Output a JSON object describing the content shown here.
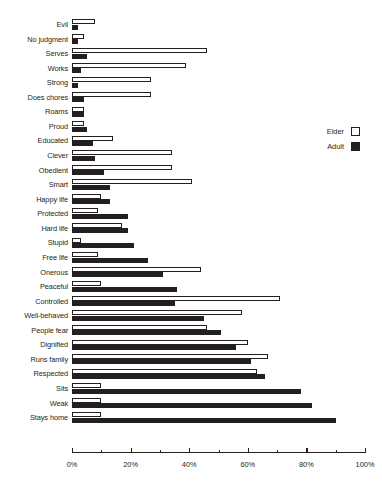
{
  "chart_data": {
    "type": "bar",
    "orientation": "horizontal",
    "title": "",
    "subtitle": "",
    "xlabel": "",
    "ylabel": "",
    "xlim": [
      0,
      100
    ],
    "xunit": "%",
    "grid": false,
    "legend_position": "right",
    "axis": {
      "major_ticks": [
        0,
        20,
        40,
        60,
        80,
        100
      ],
      "major_tick_labels": [
        "0%",
        "20%",
        "40%",
        "60%",
        "80%",
        "100%"
      ],
      "minor_ticks": [
        10,
        30,
        50,
        70,
        90
      ]
    },
    "categories": [
      "Evil",
      "No judgment",
      "Serves",
      "Works",
      "Strong",
      "Does chores",
      "Roams",
      "Proud",
      "Educated",
      "Clever",
      "Obedient",
      "Smart",
      "Happy life",
      "Protected",
      "Hard life",
      "Stupid",
      "Free life",
      "Onerous",
      "Peaceful",
      "Controlled",
      "Well-behaved",
      "People fear",
      "Dignified",
      "Runs family",
      "Respected",
      "Sits",
      "Weak",
      "Stays home"
    ],
    "series": [
      {
        "name": "Elder",
        "color": "#ffffff",
        "edge_color": "#231f20",
        "values": [
          8,
          4,
          46,
          39,
          27,
          27,
          4,
          4,
          14,
          34,
          34,
          41,
          10,
          9,
          17,
          3,
          9,
          44,
          10,
          71,
          58,
          46,
          60,
          67,
          63,
          10,
          10,
          10
        ]
      },
      {
        "name": "Adult",
        "color": "#231f20",
        "edge_color": "#231f20",
        "values": [
          2,
          2,
          5,
          3,
          2,
          4,
          4,
          5,
          7,
          8,
          11,
          13,
          13,
          19,
          19,
          21,
          26,
          31,
          36,
          35,
          45,
          51,
          56,
          61,
          66,
          78,
          82,
          90
        ]
      }
    ]
  },
  "legend": {
    "entries": [
      {
        "label": "Elder",
        "swatch": "elder"
      },
      {
        "label": "Adult",
        "swatch": "adult"
      }
    ]
  }
}
